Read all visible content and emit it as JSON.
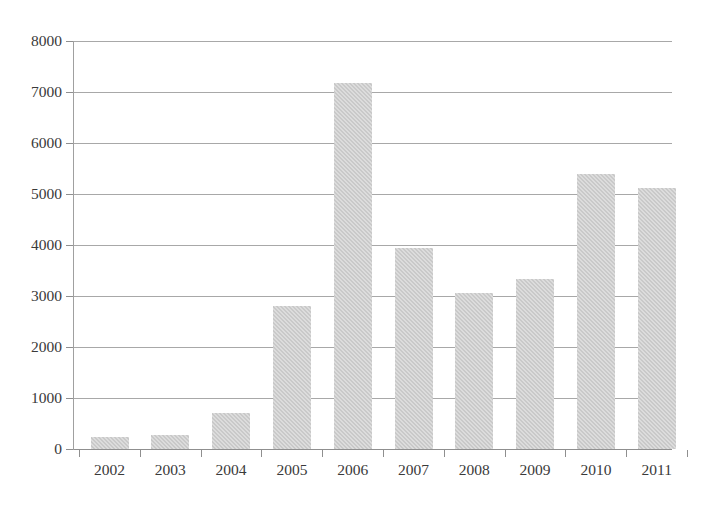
{
  "chart_data": {
    "type": "bar",
    "title": "",
    "subtitle": "",
    "xlabel": "",
    "ylabel": "",
    "categories": [
      "2002",
      "2003",
      "2004",
      "2005",
      "2006",
      "2007",
      "2008",
      "2009",
      "2010",
      "2011"
    ],
    "values": [
      235,
      275,
      710,
      2800,
      7180,
      3950,
      3050,
      3330,
      5400,
      5120
    ],
    "series": [
      {
        "name": "",
        "values": [
          235,
          275,
          710,
          2800,
          7180,
          3950,
          3050,
          3330,
          5400,
          5120
        ]
      }
    ],
    "ylim": [
      0,
      8000
    ],
    "y_ticks": [
      0,
      1000,
      2000,
      3000,
      4000,
      5000,
      6000,
      7000,
      8000
    ],
    "y_tick_labels": [
      "0",
      "1000",
      "2000",
      "3000",
      "4000",
      "5000",
      "6000",
      "7000",
      "8000"
    ],
    "x_tick_labels": [
      "2002",
      "2003",
      "2004",
      "2005",
      "2006",
      "2007",
      "2008",
      "2009",
      "2010",
      "2011"
    ],
    "grid": true,
    "grid_axis": "y",
    "legend": false,
    "legend_position": "none",
    "annotations": [],
    "colors": {
      "bar_fill": "#c9c9c9",
      "gridline": "#a8a8a8",
      "axis": "#8f8f8f",
      "tick_label": "#3a3a3a",
      "background": "#ffffff"
    }
  }
}
